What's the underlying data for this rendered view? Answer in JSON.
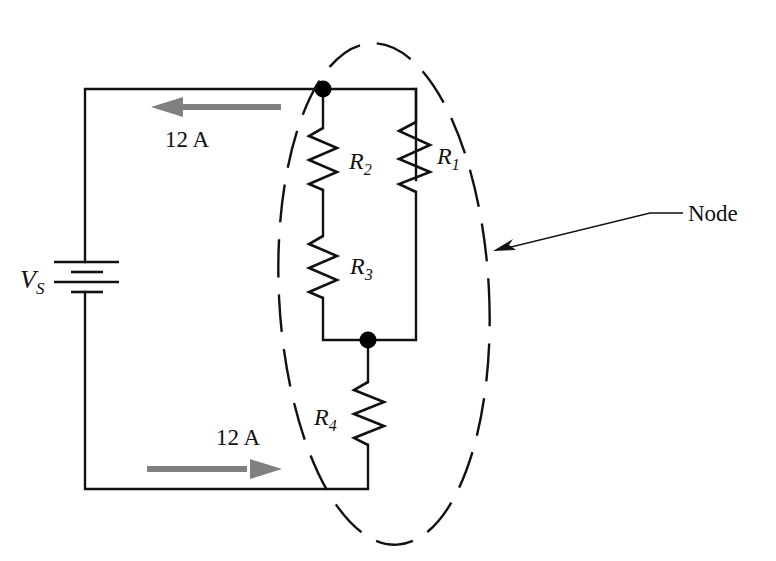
{
  "diagram": {
    "type": "circuit-schematic",
    "colors": {
      "wire": "#111111",
      "current_arrow": "#808080",
      "background": "#ffffff"
    },
    "source": {
      "symbol": "battery-icon",
      "label_main": "V",
      "label_sub": "S"
    },
    "resistors": [
      {
        "id": "R1",
        "label_main": "R",
        "label_sub": "1",
        "branch": "right-parallel"
      },
      {
        "id": "R2",
        "label_main": "R",
        "label_sub": "2",
        "branch": "left-parallel-upper"
      },
      {
        "id": "R3",
        "label_main": "R",
        "label_sub": "3",
        "branch": "left-parallel-lower"
      },
      {
        "id": "R4",
        "label_main": "R",
        "label_sub": "4",
        "branch": "series-bottom"
      }
    ],
    "currents": [
      {
        "position": "top",
        "value": "12 A",
        "direction": "left"
      },
      {
        "position": "bottom",
        "value": "12 A",
        "direction": "right"
      }
    ],
    "node_boundary": {
      "style": "dashed-ellipse",
      "callout_label": "Node"
    },
    "junctions": 2
  }
}
